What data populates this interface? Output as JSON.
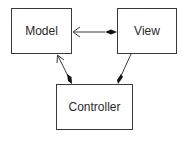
{
  "diagram": {
    "type": "uml-class-diagram",
    "nodes": [
      {
        "id": "model",
        "label": "Model"
      },
      {
        "id": "view",
        "label": "View"
      },
      {
        "id": "controller",
        "label": "Controller"
      }
    ],
    "edges": [
      {
        "from": "view",
        "to": "model",
        "source_end": "filled-diamond",
        "target_end": "open-arrow"
      },
      {
        "from": "controller",
        "to": "model",
        "source_end": "filled-diamond",
        "target_end": "open-arrow"
      },
      {
        "from": "controller",
        "to": "view",
        "source_end": "filled-diamond",
        "target_end": "none"
      }
    ],
    "colors": {
      "line": "#3a3a3a",
      "text": "#2a2a2a",
      "background": "#ffffff"
    }
  }
}
